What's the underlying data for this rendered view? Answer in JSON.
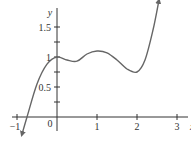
{
  "chart_data": {
    "type": "line",
    "title": "",
    "xlabel": "x",
    "ylabel": "y",
    "xlim": [
      -1,
      3
    ],
    "ylim": [
      -0.3,
      1.95
    ],
    "grid": false,
    "legend": null,
    "x_ticks": [
      -1,
      0,
      1,
      2,
      3
    ],
    "x_tick_labels": [
      "−1",
      "0",
      "1",
      "2",
      "3"
    ],
    "y_ticks": [
      0.25,
      0.5,
      0.75,
      1,
      1.25,
      1.5
    ],
    "y_tick_labels": [
      "",
      "0.5",
      "",
      "1",
      "",
      "1.5"
    ],
    "series": [
      {
        "name": "f(x)",
        "x": [
          -0.88,
          -0.75,
          -0.5,
          -0.25,
          0,
          0.25,
          0.5,
          0.75,
          1,
          1.25,
          1.5,
          1.75,
          2,
          2.2,
          2.4,
          2.55
        ],
        "y": [
          -0.3,
          0.0,
          0.55,
          0.88,
          1.0,
          0.95,
          0.93,
          1.05,
          1.1,
          1.07,
          0.95,
          0.8,
          0.75,
          0.95,
          1.45,
          1.95
        ],
        "arrow_ends": true
      }
    ]
  },
  "axes": {
    "x_label": "x",
    "y_label": "y",
    "origin_label": "0"
  },
  "colors": {
    "curve": "#666666",
    "axis": "#333333"
  }
}
